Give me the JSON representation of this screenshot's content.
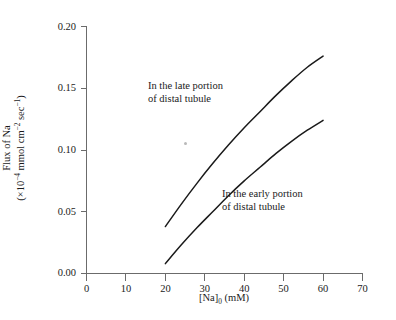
{
  "chart_data": {
    "type": "line",
    "title": "",
    "xlabel": "[Na]0 (mM)",
    "xlabel_parts": {
      "pre": "[Na]",
      "sub": "0",
      "post": " (mM)"
    },
    "ylabel_line1": "Flux of Na",
    "ylabel_line2": "(×10⁻⁴ mmol cm⁻² sec⁻¹)",
    "ylabel_line2_parts": {
      "a": "(×10",
      "sup1": "−4",
      "b": " mmol cm",
      "sup2": "−2",
      "c": " sec",
      "sup3": "−1",
      "d": ")"
    },
    "xlim": [
      0,
      70
    ],
    "ylim": [
      0.0,
      0.2
    ],
    "xticks": [
      0,
      10,
      20,
      30,
      40,
      50,
      60,
      70
    ],
    "xtick_labels": [
      "0",
      "10",
      "20",
      "30",
      "40",
      "50",
      "60",
      "70"
    ],
    "yticks": [
      0.0,
      0.05,
      0.1,
      0.15,
      0.2
    ],
    "ytick_labels": [
      "0.00",
      "0.05",
      "0.10",
      "0.15",
      "0.20"
    ],
    "grid": false,
    "legend_position": "inline-annotations",
    "series": [
      {
        "name": "In the late portion of distal tubule",
        "color": "#1a1a1a",
        "x": [
          20,
          24,
          28,
          32,
          36,
          40,
          44,
          48,
          52,
          56,
          60
        ],
        "values": [
          0.038,
          0.056,
          0.073,
          0.089,
          0.104,
          0.118,
          0.131,
          0.144,
          0.156,
          0.167,
          0.176
        ]
      },
      {
        "name": "In the early portion of distal tubule",
        "color": "#1a1a1a",
        "x": [
          20,
          24,
          28,
          32,
          36,
          40,
          44,
          48,
          52,
          56,
          60
        ],
        "values": [
          0.008,
          0.023,
          0.037,
          0.05,
          0.063,
          0.075,
          0.086,
          0.097,
          0.107,
          0.116,
          0.124
        ]
      }
    ],
    "annotations": [
      {
        "id": "late",
        "line1": "In the late portion",
        "line2": "of distal tubule",
        "x": 29,
        "y": 0.142
      },
      {
        "id": "early",
        "line1": "In the early portion",
        "line2": "of distal tubule",
        "x": 46,
        "y": 0.063
      }
    ]
  },
  "axis_color": "#6b6b6b",
  "curve_color": "#1a1a1a"
}
